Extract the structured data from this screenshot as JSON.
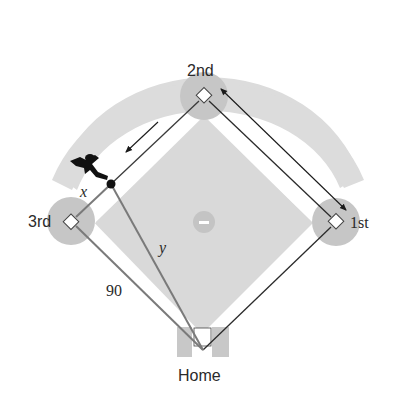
{
  "diagram": {
    "bases": {
      "second": "2nd",
      "third": "3rd",
      "first": "1st",
      "home": "Home"
    },
    "labels": {
      "runner_distance": "x",
      "hypotenuse": "y",
      "side_length": "90"
    },
    "colors": {
      "infield": "#dadada",
      "outfield_arc": "#dcdcdc",
      "base_circle": "#c4c4c4",
      "base_path": "#ffffff",
      "line_dark": "#2b2b2b",
      "line_gray": "#7a7a7a",
      "runner": "#111111"
    }
  }
}
